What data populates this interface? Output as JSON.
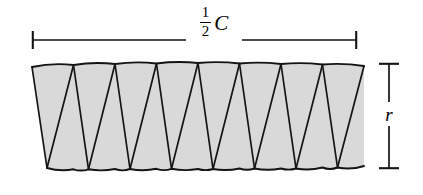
{
  "figure": {
    "colors": {
      "stroke": "#141414",
      "fill": "#d9d9d9",
      "background": "#ffffff"
    },
    "labels": {
      "width": {
        "numerator": "1",
        "denominator": "2",
        "symbol": "C",
        "text": "1/2 C"
      },
      "height": {
        "symbol": "r",
        "text": "r"
      }
    },
    "dimensions": {
      "width_line": {
        "x1": 32,
        "x2": 357,
        "y": 40
      },
      "height_line": {
        "x": 389,
        "y1": 63,
        "y2": 169
      }
    },
    "strip": {
      "segments": 8,
      "top_y": 64,
      "bottom_y": 168,
      "left_x": 32,
      "right_x": 364,
      "bulge": 3
    }
  }
}
